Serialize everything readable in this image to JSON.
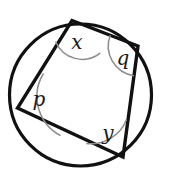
{
  "figure": {
    "name": "cyclic-quadrilateral-angles",
    "background_color": "#ffffff",
    "stroke_color": "#111111",
    "arc_color": "#8d8d8d",
    "label_color": "#1b1b1b",
    "circle": {
      "center_x": 80.5,
      "center_y": 95,
      "radius": 71,
      "stroke_width": 3.2
    },
    "quadrilateral": {
      "stroke_width": 3.4,
      "fill": "none",
      "vertices": [
        {
          "name": "top",
          "x": 72,
          "y": 20.5
        },
        {
          "name": "right",
          "x": 138,
          "y": 46
        },
        {
          "name": "bottom",
          "x": 123,
          "y": 157
        },
        {
          "name": "left",
          "x": 17.5,
          "y": 108
        }
      ],
      "points_path": "72,20.5 138,46 123,157 17.5,108"
    },
    "angles": [
      {
        "id": "angle-x",
        "label": "x",
        "vertex": "top",
        "label_x": 77,
        "label_y": 43,
        "arc_path": "M 55.6 41.5 A 29 29 0 0 0 100.2 53.2",
        "arc_width": 1.5
      },
      {
        "id": "angle-q",
        "label": "q",
        "vertex": "right",
        "label_x": 123,
        "label_y": 59,
        "arc_path": "M 110.3 35.3 A 30 30 0 0 0 133.9 75.8",
        "arc_width": 1.5
      },
      {
        "id": "angle-p",
        "label": "p",
        "vertex": "left",
        "label_x": 39,
        "label_y": 100,
        "arc_path": "M 43.5 73.5 A 44 44 0 0 0 60.5 135.5",
        "arc_width": 1.5
      },
      {
        "id": "angle-y",
        "label": "y",
        "vertex": "bottom",
        "label_x": 108,
        "label_y": 134,
        "arc_path": "M 86.2 143.5 A 38 38 0 0 0 126.5 119.4",
        "arc_width": 1.5
      }
    ]
  }
}
